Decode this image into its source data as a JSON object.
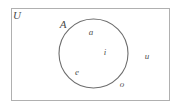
{
  "diagram": {
    "type": "venn",
    "title_visible": false,
    "universal_set": {
      "label": "U",
      "shape": "rectangle",
      "stroke_color": "#b0b0b0",
      "fill_color": "#ffffff",
      "label_x": 17,
      "label_y": 15
    },
    "sets": [
      {
        "label": "A",
        "shape": "circle",
        "stroke_color": "#6e6e6e",
        "fill_color": "none",
        "center_x": 93.5,
        "center_y": 53.5,
        "radius": 34.5,
        "label_x": 63,
        "label_y": 24
      }
    ],
    "elements": [
      {
        "label": "a",
        "x": 91,
        "y": 32,
        "region": "inside-A"
      },
      {
        "label": "i",
        "x": 105,
        "y": 52,
        "region": "inside-A"
      },
      {
        "label": "e",
        "x": 77,
        "y": 72,
        "region": "inside-A"
      },
      {
        "label": "o",
        "x": 122,
        "y": 84,
        "region": "outside-A"
      },
      {
        "label": "u",
        "x": 147,
        "y": 56,
        "region": "outside-A"
      }
    ]
  }
}
